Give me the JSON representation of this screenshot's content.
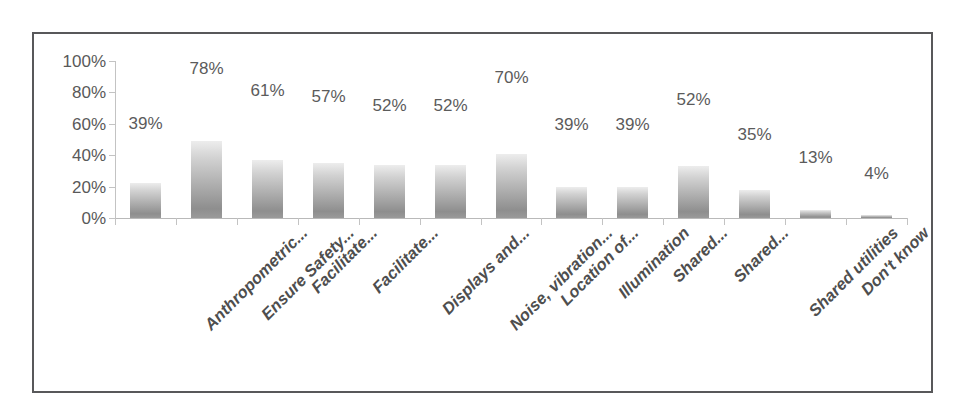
{
  "chart_data": {
    "type": "bar",
    "title": "",
    "subtitle": "",
    "xlabel": "",
    "ylabel": "",
    "ylim": [
      0,
      100
    ],
    "ytick_labels": [
      "100%",
      "80%",
      "60%",
      "40%",
      "20%",
      "0%"
    ],
    "ytick_values": [
      100,
      80,
      60,
      40,
      20,
      0
    ],
    "grid": false,
    "legend": false,
    "legend_position": "none",
    "orientation": "vertical",
    "bar_color": "#a9a9a9",
    "data_label_color": "#5b5b5b",
    "axis_color": "#c3c3c3",
    "border_color": "#58585a",
    "categories": [
      "Anthropometric...",
      "Ensure Safety...",
      "Facilitate...",
      "Facilitate...",
      "Displays and...",
      "Noise, vibration...",
      "Location of...",
      "Illumination",
      "Shared...",
      "Shared...",
      "Shared utilities",
      "Don't know",
      ""
    ],
    "data_labels": [
      "39%",
      "78%",
      "61%",
      "57%",
      "52%",
      "52%",
      "70%",
      "39%",
      "39%",
      "52%",
      "35%",
      "13%",
      "4%"
    ],
    "values": [
      39,
      78,
      61,
      57,
      52,
      52,
      70,
      39,
      39,
      52,
      35,
      13,
      4
    ],
    "plotted_heights": [
      22,
      49,
      37,
      35,
      34,
      34,
      41,
      20,
      20,
      33,
      18,
      5,
      2
    ],
    "label_y_percent": [
      55,
      90,
      76,
      72,
      66,
      66,
      84,
      54,
      54,
      70,
      48,
      33,
      23
    ]
  }
}
